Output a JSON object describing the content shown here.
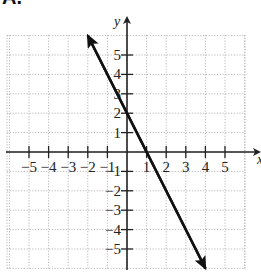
{
  "panel_label": "A.",
  "chart_data": {
    "type": "line",
    "title": "",
    "xlabel": "x",
    "ylabel": "y",
    "xlim": [
      -6,
      6
    ],
    "ylim": [
      -6,
      6
    ],
    "grid": true,
    "grid_style": "dotted",
    "x_ticks": [
      -5,
      -4,
      -3,
      -2,
      -1,
      1,
      2,
      3,
      4,
      5
    ],
    "y_ticks": [
      -5,
      -4,
      -3,
      -2,
      -1,
      1,
      2,
      3,
      4,
      5
    ],
    "x_tick_labels": [
      "−5",
      "−4",
      "−3",
      "−2",
      "−1",
      "1",
      "2",
      "3",
      "4",
      "5"
    ],
    "y_tick_labels": [
      "−5",
      "−4",
      "−3",
      "−2",
      "−1",
      "1",
      "2",
      "3",
      "4",
      "5"
    ],
    "series": [
      {
        "name": "line",
        "equation": "y = -1.5x + 3",
        "slope": -1.5,
        "y_intercept": 3,
        "x_intercept": 2,
        "x": [
          -2,
          0,
          2,
          4
        ],
        "y": [
          6,
          3,
          0,
          -6
        ],
        "arrows": "both",
        "color": "#111111"
      }
    ]
  },
  "colors": {
    "grid": "#b8b8b8",
    "axis": "#222222",
    "line": "#111111"
  }
}
